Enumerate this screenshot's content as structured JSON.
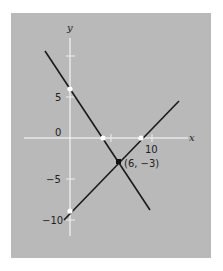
{
  "diagram": {
    "type": "line_graph",
    "axes": {
      "x_label": "x",
      "y_label": "y"
    },
    "x_ticks": [
      {
        "value": 5,
        "label": ""
      },
      {
        "value": 10,
        "label": "10"
      }
    ],
    "y_ticks": [
      {
        "value": 10,
        "label": ""
      },
      {
        "value": 5,
        "label": "5"
      },
      {
        "value": 0,
        "label": "0"
      },
      {
        "value": -5,
        "label": "−5"
      },
      {
        "value": -10,
        "label": "−10"
      }
    ],
    "lines": [
      {
        "name": "line-1",
        "equation": "y = -1.5x + 6",
        "from": [
          -3,
          10.5
        ],
        "to": [
          10,
          -9
        ]
      },
      {
        "name": "line-2",
        "equation": "y = x - 9",
        "from": [
          -1,
          -10
        ],
        "to": [
          15,
          6
        ]
      }
    ],
    "points": [
      {
        "name": "y-intercept-1",
        "x": 0,
        "y": 6,
        "style": "open"
      },
      {
        "name": "x-intercept-1",
        "x": 4,
        "y": 0,
        "style": "open"
      },
      {
        "name": "x-intercept-2",
        "x": 9,
        "y": 0,
        "style": "open"
      },
      {
        "name": "y-intercept-2",
        "x": 0,
        "y": -9,
        "style": "open"
      },
      {
        "name": "intersection",
        "x": 6,
        "y": -3,
        "style": "filled",
        "label": "(6, −3)"
      }
    ],
    "colors": {
      "background": "#b9b9b9",
      "axis": "#ffffff",
      "line": "#1a1a1a",
      "text": "#222222"
    }
  }
}
